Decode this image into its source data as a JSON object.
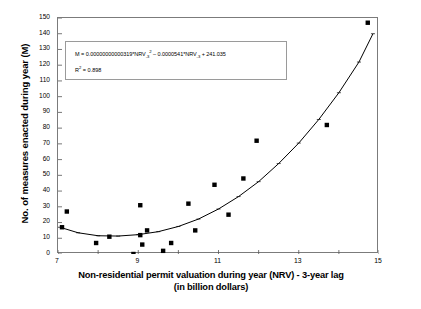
{
  "chart_data": {
    "type": "scatter",
    "title": "",
    "xlabel": "Non-residential permit valuation during year (NRV) - 3-year lag (in billion dollars)",
    "xlabel_line1": "Non-residential permit valuation during year (NRV) - 3-year lag",
    "xlabel_line2": "(in billion dollars)",
    "ylabel": "No. of measures enacted during year (M)",
    "xlim": [
      7,
      15
    ],
    "ylim": [
      0,
      150
    ],
    "xticks": [
      7,
      9,
      11,
      13,
      15
    ],
    "xticks_minor": [
      8,
      10,
      12,
      14
    ],
    "yticks": [
      0,
      10,
      20,
      30,
      40,
      50,
      60,
      70,
      80,
      90,
      100,
      110,
      120,
      130,
      140,
      150
    ],
    "grid": false,
    "legend": false,
    "marker": "filled-square",
    "marker_color": "#000000",
    "line_color": "#000000",
    "points": [
      {
        "x": 7.1,
        "y": 17
      },
      {
        "x": 7.22,
        "y": 27
      },
      {
        "x": 7.95,
        "y": 7
      },
      {
        "x": 8.28,
        "y": 11
      },
      {
        "x": 8.88,
        "y": 0
      },
      {
        "x": 9.05,
        "y": 12
      },
      {
        "x": 9.05,
        "y": 31
      },
      {
        "x": 9.1,
        "y": 6
      },
      {
        "x": 9.22,
        "y": 15
      },
      {
        "x": 9.62,
        "y": 2
      },
      {
        "x": 9.82,
        "y": 7
      },
      {
        "x": 10.25,
        "y": 32
      },
      {
        "x": 10.42,
        "y": 15
      },
      {
        "x": 10.9,
        "y": 44
      },
      {
        "x": 11.25,
        "y": 25
      },
      {
        "x": 11.62,
        "y": 48
      },
      {
        "x": 11.95,
        "y": 72
      },
      {
        "x": 13.7,
        "y": 82
      },
      {
        "x": 14.72,
        "y": 147
      }
    ],
    "fit_line": {
      "type": "quadratic",
      "label": "trendline",
      "x_points": [
        7.05,
        7.5,
        8.0,
        8.5,
        9.0,
        9.5,
        10.0,
        10.5,
        11.0,
        11.5,
        12.0,
        12.5,
        13.0,
        13.5,
        14.0,
        14.5,
        14.85
      ],
      "y_points": [
        17,
        13.5,
        11.6,
        11.4,
        12.3,
        14.2,
        17.5,
        22.2,
        28.6,
        36.5,
        46.0,
        57.5,
        70.5,
        85.5,
        102.5,
        122.0,
        140.0
      ]
    },
    "annotation": {
      "equation_prefix": "M = 0.00000000000319*NRV",
      "equation_sub1": "-3",
      "equation_sup1": "2",
      "equation_mid": " – 0.0000541*NRV",
      "equation_sub2": "-3",
      "equation_suffix": " + 241.035",
      "r2_prefix": "R",
      "r2_sup": "2",
      "r2_value": " = 0.898"
    }
  },
  "axes": {
    "y_tick_labels": [
      "150",
      "140",
      "130",
      "120",
      "110",
      "100",
      "90",
      "80",
      "70",
      "60",
      "50",
      "40",
      "30",
      "20",
      "10",
      "0"
    ],
    "x_tick_labels": [
      "7",
      "9",
      "11",
      "13",
      "15"
    ]
  },
  "colors": {
    "marker": "#000000",
    "frame": "#7b7b7b",
    "box_border": "#9a9a9a",
    "text": "#000000"
  }
}
